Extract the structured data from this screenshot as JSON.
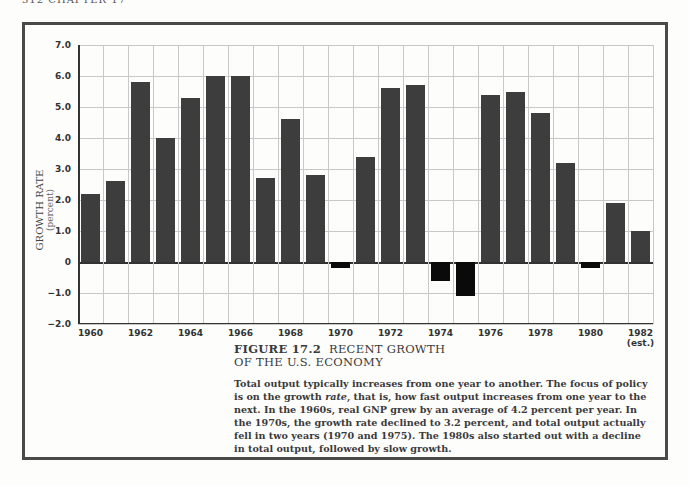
{
  "page_header": "312   CHAPTER 17",
  "figure": {
    "label": "FIGURE 17.2",
    "title_line1": "RECENT GROWTH",
    "title_line2": "OF THE U.S. ECONOMY",
    "body_parts": [
      "Total output typically increases from one year to another. The focus of policy is on the growth ",
      "rate",
      ", that is, how fast output increases from one year to the next. In the 1960s, real GNP grew by an average of 4.2 percent per year. In the 1970s, the growth rate declined to 3.2 percent, and total output actually fell in two years (1970 and 1975). The 1980s also started out with a decline in total output, followed by slow growth."
    ]
  },
  "colors": {
    "positive_bar": "#3d3d3d",
    "negative_bar": "#0a0a0a",
    "grid": "#c8c8c8",
    "frame": "#4a4a4a"
  },
  "chart_data": {
    "type": "bar",
    "xlabel": "",
    "ylabel": "GROWTH RATE",
    "ylabel_sub": "(percent)",
    "ylim": [
      -2.0,
      7.0
    ],
    "yticks": [
      7.0,
      6.0,
      5.0,
      4.0,
      3.0,
      2.0,
      1.0,
      0,
      -1.0,
      -2.0
    ],
    "ytick_labels": [
      "7.0",
      "6.0",
      "5.0",
      "4.0",
      "3.0",
      "2.0",
      "1.0",
      "0",
      "−1.0",
      "−2.0"
    ],
    "grid": true,
    "categories": [
      "1960",
      "1961",
      "1962",
      "1963",
      "1964",
      "1965",
      "1966",
      "1967",
      "1968",
      "1969",
      "1970",
      "1971",
      "1972",
      "1973",
      "1974",
      "1975",
      "1976",
      "1977",
      "1978",
      "1979",
      "1980",
      "1981",
      "1982"
    ],
    "xtick_labels": [
      {
        "label": "1960",
        "index": 0
      },
      {
        "label": "1962",
        "index": 2
      },
      {
        "label": "1964",
        "index": 4
      },
      {
        "label": "1966",
        "index": 6
      },
      {
        "label": "1968",
        "index": 8
      },
      {
        "label": "1970",
        "index": 10
      },
      {
        "label": "1972",
        "index": 12
      },
      {
        "label": "1974",
        "index": 14
      },
      {
        "label": "1976",
        "index": 16
      },
      {
        "label": "1978",
        "index": 18
      },
      {
        "label": "1980",
        "index": 20
      },
      {
        "label": "1982",
        "sub": "(est.)",
        "index": 22
      }
    ],
    "values": [
      2.2,
      2.6,
      5.8,
      4.0,
      5.3,
      6.0,
      6.0,
      2.7,
      4.6,
      2.8,
      -0.2,
      3.4,
      5.6,
      5.7,
      -0.6,
      -1.1,
      5.4,
      5.5,
      4.8,
      3.2,
      -0.2,
      1.9,
      1.0
    ],
    "legend": null,
    "annotations": [
      "1982 (est.)"
    ]
  }
}
